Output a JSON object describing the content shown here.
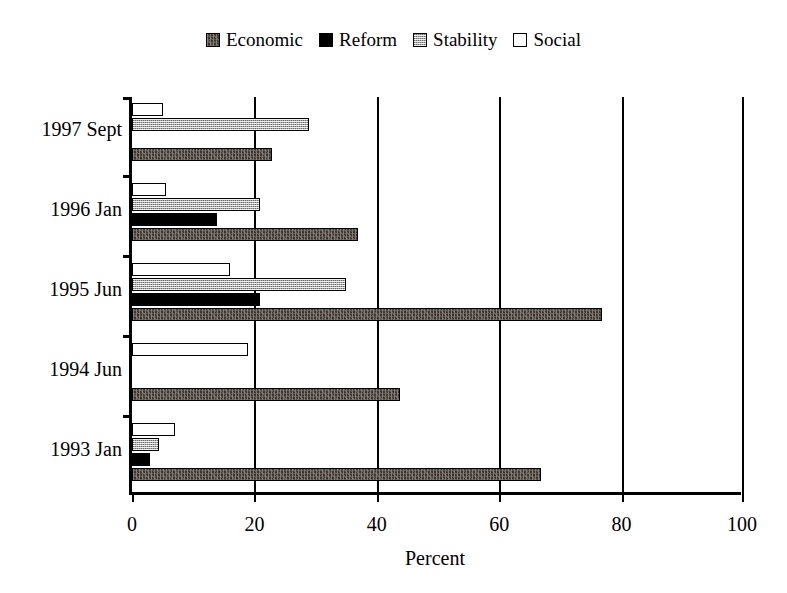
{
  "chart_data": {
    "type": "bar",
    "orientation": "horizontal",
    "title": "",
    "xlabel": "Percent",
    "ylabel": "",
    "xlim": [
      0,
      100
    ],
    "xticks": [
      0,
      20,
      40,
      60,
      80,
      100
    ],
    "grid": true,
    "legend_position": "top-center",
    "categories": [
      "1993 Jan",
      "1994 Jun",
      "1995 Jun",
      "1996 Jan",
      "1997 Sept"
    ],
    "series": [
      {
        "name": "Economic",
        "color": "#3a3632",
        "pattern": "dark-textured",
        "values": [
          67,
          44,
          77,
          37,
          23
        ]
      },
      {
        "name": "Reform",
        "color": "#000000",
        "pattern": "solid-black",
        "values": [
          3,
          0,
          21,
          14,
          0
        ]
      },
      {
        "name": "Stability",
        "color": "#a9a9a9",
        "pattern": "gray-hatch",
        "values": [
          4.5,
          0,
          35,
          21,
          29
        ]
      },
      {
        "name": "Social",
        "color": "#ffffff",
        "pattern": "white-outline",
        "values": [
          7,
          19,
          16,
          5.5,
          5
        ]
      }
    ]
  },
  "legend": {
    "items": [
      {
        "label": "Economic"
      },
      {
        "label": "Reform"
      },
      {
        "label": "Stability"
      },
      {
        "label": "Social"
      }
    ]
  },
  "axis": {
    "x_title": "Percent",
    "x_tick_labels": [
      "0",
      "20",
      "40",
      "60",
      "80",
      "100"
    ],
    "y_tick_labels": [
      "1993 Jan",
      "1994 Jun",
      "1995 Jun",
      "1996 Jan",
      "1997 Sept"
    ]
  }
}
